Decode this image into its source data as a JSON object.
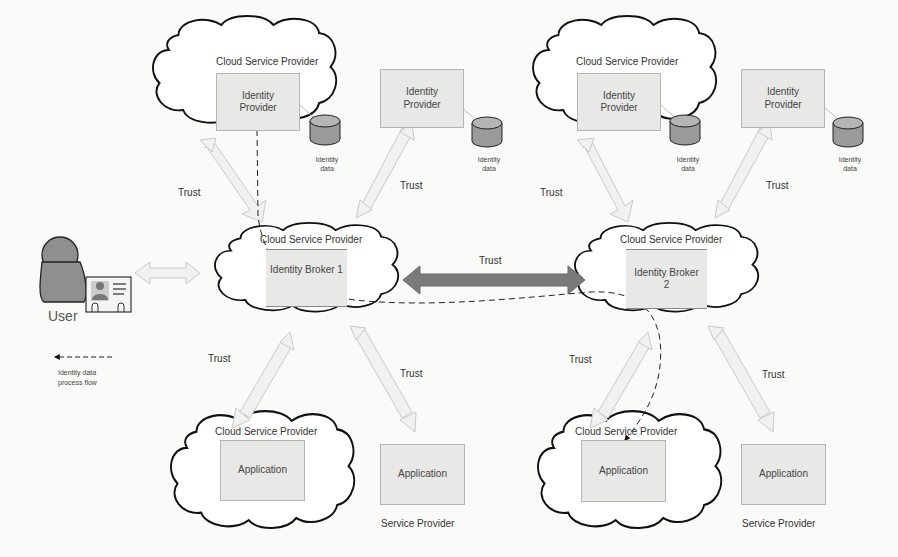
{
  "diagram": {
    "type": "federated identity architecture",
    "legend": {
      "icon": "dashed-arrow-left",
      "label_line1": "Identity data",
      "label_line2": "process flow"
    },
    "user": {
      "label": "User"
    },
    "cloud_label": "Cloud Service Provider",
    "trust_label": "Trust",
    "left": {
      "idp_cloud": {
        "cloud": "Cloud Service Provider",
        "box": "Identity Provider",
        "db": "Identity data"
      },
      "idp_standalone": {
        "box": "Identity Provider",
        "db": "Identity data"
      },
      "broker": {
        "cloud": "Cloud Service Provider",
        "box": "Identity Broker 1"
      },
      "app_cloud": {
        "cloud": "Cloud Service Provider",
        "box": "Application"
      },
      "app_sp": {
        "box": "Application",
        "caption": "Service Provider"
      }
    },
    "right": {
      "idp_cloud": {
        "cloud": "Cloud Service Provider",
        "box": "Identity Provider",
        "db": "Identity data"
      },
      "idp_standalone": {
        "box": "Identity Provider",
        "db": "Identity data"
      },
      "broker": {
        "cloud": "Cloud Service Provider",
        "box": "Identity Broker 2"
      },
      "app_cloud": {
        "cloud": "Cloud Service Provider",
        "box": "Application"
      },
      "app_sp": {
        "box": "Application",
        "caption": "Service Provider"
      }
    },
    "trust_labels": [
      "Trust",
      "Trust",
      "Trust",
      "Trust",
      "Trust",
      "Trust",
      "Trust",
      "Trust",
      "Trust"
    ],
    "colors": {
      "trust_arrow_light": "#eeeeec",
      "trust_arrow_dark": "#7a7a7a",
      "box_fill": "#e8e8e6",
      "db_fill": "#9a9a98"
    }
  }
}
